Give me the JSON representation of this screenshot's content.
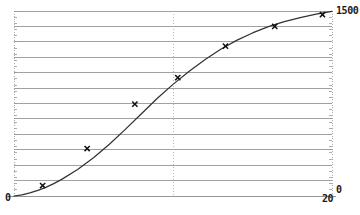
{
  "chart_data": {
    "type": "line",
    "title": "",
    "subtitle": "",
    "xlabel": "",
    "ylabel": "",
    "xlim": [
      0,
      20
    ],
    "ylim": [
      0,
      1500
    ],
    "grid": true,
    "grid_horizontal_lines": 12,
    "grid_vertical_dotted_at": [
      10
    ],
    "legend": null,
    "x_ticks": [
      "0",
      "20"
    ],
    "y_ticks": [
      "0",
      "1500"
    ],
    "annotations": [],
    "series": [
      {
        "name": "fitted-curve",
        "type": "line",
        "color": "#333333",
        "x": [
          0.0,
          0.5,
          1.0,
          1.5,
          2.0,
          2.5,
          3.0,
          4.0,
          5.0,
          6.0,
          7.0,
          8.0,
          9.0,
          10.0,
          11.0,
          12.0,
          13.0,
          14.0,
          15.0,
          16.0,
          17.0,
          18.0,
          19.0,
          20.0
        ],
        "y": [
          0,
          10,
          25,
          45,
          70,
          100,
          135,
          215,
          310,
          420,
          540,
          665,
          790,
          905,
          1010,
          1105,
          1190,
          1262,
          1322,
          1373,
          1414,
          1447,
          1474,
          1496
        ]
      },
      {
        "name": "data-points",
        "type": "scatter",
        "marker": "x",
        "color": "#111111",
        "x": [
          1.8,
          4.6,
          7.6,
          10.3,
          13.3,
          16.4,
          19.4
        ],
        "y": [
          85,
          385,
          745,
          960,
          1215,
          1375,
          1470
        ]
      }
    ]
  },
  "axes": {
    "y_max_label": "1500",
    "y_min_label": "0",
    "x_min_label": "0",
    "x_max_label": "20"
  },
  "style": {
    "background": "#ffffff",
    "grid_color": "#8a8a8a",
    "dotted_color": "#a8a8a8",
    "curve_color": "#333333",
    "marker_color": "#111111",
    "text_color": "#1a1a1a"
  }
}
